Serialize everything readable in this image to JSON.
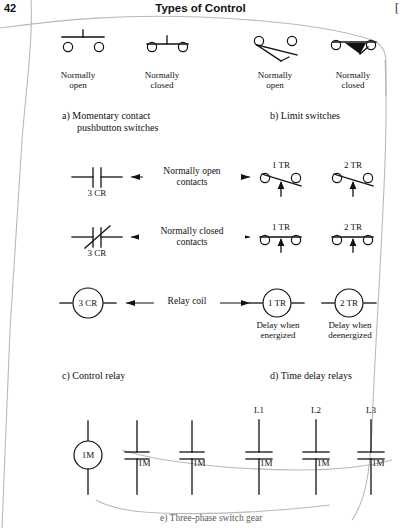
{
  "header": {
    "folio": "42",
    "running_head": "Types of Control",
    "right_bracket": "["
  },
  "sections": {
    "a": {
      "caption_line1": "a)  Momentary contact",
      "caption_line2": "pushbutton switches",
      "symbols": [
        {
          "name": "momentary-no",
          "label_line1": "Normally",
          "label_line2": "open"
        },
        {
          "name": "momentary-nc",
          "label_line1": "Normally",
          "label_line2": "closed"
        }
      ]
    },
    "b": {
      "caption_line1": "b)  Limit switches",
      "symbols": [
        {
          "name": "limit-no",
          "label_line1": "Normally",
          "label_line2": "open"
        },
        {
          "name": "limit-nc",
          "label_line1": "Normally",
          "label_line2": "closed"
        }
      ]
    },
    "c": {
      "caption_line1": "c)  Control relay",
      "rows": [
        {
          "name": "no-contacts",
          "left_symbol": "3 CR",
          "arrow_line1": "Normally open",
          "arrow_line2": "contacts"
        },
        {
          "name": "nc-contacts",
          "left_symbol": "3 CR",
          "arrow_line1": "Normally closed",
          "arrow_line2": "contacts"
        },
        {
          "name": "relay-coil",
          "left_symbol": "3 CR",
          "arrow_line1": "Relay coil",
          "arrow_line2": ""
        }
      ]
    },
    "d": {
      "caption_line1": "d)  Time delay relays",
      "rows": [
        {
          "name": "td-no",
          "sym1": "1 TR",
          "sym2": "2 TR"
        },
        {
          "name": "td-nc",
          "sym1": "1 TR",
          "sym2": "2 TR"
        },
        {
          "name": "td-coils",
          "sym1": "1 TR",
          "sym2": "2 TR",
          "note1_line1": "Delay when",
          "note1_line2": "energized",
          "note2_line1": "Delay when",
          "note2_line2": "deenergized"
        }
      ]
    },
    "e": {
      "caption": "e)  Three-phase switch gear",
      "coil": "1M",
      "aux_contacts": [
        "1M",
        "1M"
      ],
      "phases": [
        {
          "line_label": "L1",
          "contact_label": "1M"
        },
        {
          "line_label": "L2",
          "contact_label": "1M"
        },
        {
          "line_label": "L3",
          "contact_label": "1M"
        }
      ]
    }
  },
  "colors": {
    "ink": "#111111",
    "paper": "#ffffff",
    "scan_edge": "#b9b9b9"
  }
}
